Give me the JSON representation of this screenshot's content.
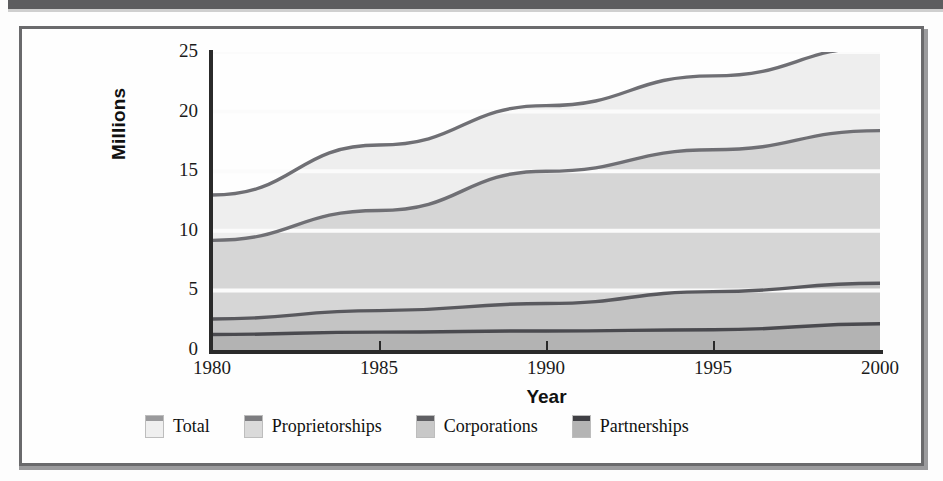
{
  "figure": {
    "caption_none": "",
    "frame_color": "#6a6a6c"
  },
  "chart_data": {
    "type": "area",
    "title": "",
    "subtitle": "",
    "xlabel": "Year",
    "ylabel": "Millions",
    "x": [
      1980,
      1985,
      1990,
      1995,
      2000
    ],
    "xlim": [
      1980,
      2000
    ],
    "ylim": [
      0,
      25
    ],
    "yticks": [
      0,
      5,
      10,
      15,
      20,
      25
    ],
    "ytick_labels": [
      "0",
      "5",
      "10",
      "15",
      "20",
      "25"
    ],
    "xticks": [
      1980,
      1985,
      1990,
      1995,
      2000
    ],
    "xtick_labels": [
      "1980",
      "1985",
      "1990",
      "1995",
      "2000"
    ],
    "grid": "horizontal-white",
    "legend_position": "below-plot",
    "stacked": false,
    "series": [
      {
        "name": "Total",
        "fill": "#eeeeee",
        "line": "#6f6f74",
        "values": [
          13.0,
          17.2,
          20.5,
          23.0,
          25.4
        ]
      },
      {
        "name": "Proprietorships",
        "fill": "#d6d6d6",
        "line": "#6f6f74",
        "values": [
          9.2,
          11.7,
          15.0,
          16.8,
          18.4
        ]
      },
      {
        "name": "Corporations",
        "fill": "#c4c4c4",
        "line": "#59595e",
        "values": [
          2.6,
          3.3,
          3.9,
          4.9,
          5.6
        ]
      },
      {
        "name": "Partnerships",
        "fill": "#b3b3b3",
        "line": "#4a4a4f",
        "values": [
          1.3,
          1.5,
          1.6,
          1.7,
          2.2
        ]
      }
    ]
  },
  "legend": {
    "items": [
      {
        "label": "Total",
        "fill": "#efefef",
        "cap": "#9a9a9c"
      },
      {
        "label": "Proprietorships",
        "fill": "#dadada",
        "cap": "#7d7d80"
      },
      {
        "label": "Corporations",
        "fill": "#c8c8c8",
        "cap": "#5f5f63"
      },
      {
        "label": "Partnerships",
        "fill": "#b4b4b4",
        "cap": "#3f3f44"
      }
    ]
  },
  "axes": {
    "y_title": "Millions",
    "x_title": "Year",
    "y_ticks": [
      "25",
      "20",
      "15",
      "10",
      "5",
      "0"
    ],
    "x_ticks": [
      "1980",
      "1985",
      "1990",
      "1995",
      "2000"
    ]
  }
}
